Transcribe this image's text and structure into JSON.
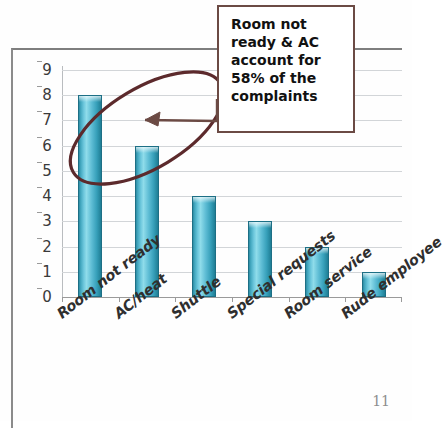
{
  "slide": {
    "page_number": "11"
  },
  "callout": {
    "text": "Room not\nready & AC\naccount for\n58% of the\ncomplaints",
    "border_color": "#6b4a44"
  },
  "annotation": {
    "ellipse_color": "#5c2a2c",
    "arrow_color": "#6b4a44"
  },
  "chart_data": {
    "type": "bar",
    "title": "",
    "xlabel": "",
    "ylabel": "",
    "categories": [
      "Room not ready",
      "AC/heat",
      "Shuttle",
      "Special requests",
      "Room service",
      "Rude employee"
    ],
    "values": [
      8,
      6,
      4,
      3,
      2,
      1
    ],
    "ylim": [
      0,
      9
    ],
    "ytick_labels": [
      "0",
      "1",
      "2",
      "3",
      "4",
      "5",
      "6",
      "7",
      "8",
      "9"
    ],
    "ytick_values": [
      0,
      1,
      2,
      3,
      4,
      5,
      6,
      7,
      8,
      9
    ],
    "grid": true,
    "legend": false,
    "bar_color": "#5dbcd4",
    "bar_edge_color": "#1d6f85",
    "gridline_color": "#d2d5d8",
    "annotation_text": "Room not ready & AC account for 58% of the complaints"
  }
}
